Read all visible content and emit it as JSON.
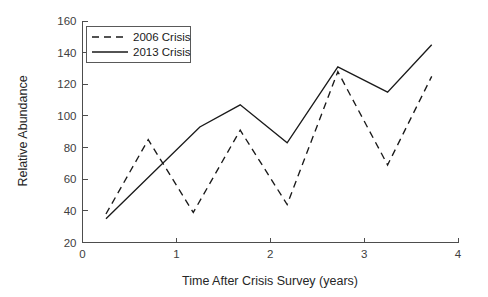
{
  "chart_data": {
    "type": "line",
    "title": "",
    "xlabel": "Time After Crisis Survey (years)",
    "ylabel": "Relative Abundance",
    "xlim": [
      0,
      4
    ],
    "ylim": [
      20,
      160
    ],
    "xticks": [
      "0",
      "1",
      "2",
      "3",
      "4"
    ],
    "yticks": [
      "20",
      "40",
      "60",
      "80",
      "100",
      "120",
      "140",
      "160"
    ],
    "xtick_values": [
      0,
      1,
      2,
      3,
      4
    ],
    "ytick_values": [
      20,
      40,
      60,
      80,
      100,
      120,
      140,
      160
    ],
    "grid": false,
    "legend_position": "upper left",
    "series": [
      {
        "name": "2006 Crisis",
        "style": "dashed",
        "color": "#1a1a1a",
        "x": [
          0.25,
          0.7,
          1.18,
          1.68,
          2.18,
          2.72,
          3.25,
          3.72
        ],
        "values": [
          38,
          85,
          39,
          91,
          44,
          128,
          69,
          125
        ]
      },
      {
        "name": "2013 Crisis",
        "style": "solid",
        "color": "#1a1a1a",
        "x": [
          0.25,
          1.25,
          1.68,
          2.18,
          2.72,
          3.25,
          3.72
        ],
        "values": [
          35,
          93,
          107,
          83,
          131,
          115,
          145
        ]
      }
    ],
    "legend": [
      {
        "label": "2006 Crisis",
        "style": "dashed"
      },
      {
        "label": "2013 Crisis",
        "style": "solid"
      }
    ]
  }
}
